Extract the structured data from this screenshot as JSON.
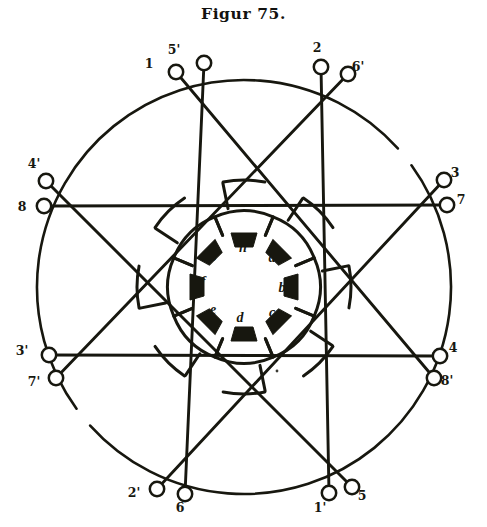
{
  "figure": {
    "title": "Figur 75.",
    "caption_position": "top-center",
    "ink_color": "#17170f",
    "paper_color": "#ffffff"
  },
  "geometry": {
    "center": {
      "x": 244,
      "y": 287
    },
    "outer_circle_radius": 207,
    "terminal_ring_radius": 211,
    "pole_ring_radius": 47,
    "lobe_ring_radius": 76,
    "arc_breaks": [
      {
        "start_deg": 318,
        "end_deg": 324
      },
      {
        "start_deg": 138,
        "end_deg": 144
      }
    ]
  },
  "terminals": [
    {
      "id": "t-1",
      "label": "1",
      "angle_deg": 247,
      "label_side": "left",
      "ring_x": 176,
      "ring_y": 72,
      "label_x": 149,
      "label_y": 68
    },
    {
      "id": "t-5p",
      "label": "5'",
      "angle_deg": 253,
      "label_side": "above",
      "ring_x": 204,
      "ring_y": 63,
      "label_x": 174,
      "label_y": 54
    },
    {
      "id": "t-2",
      "label": "2",
      "angle_deg": 287,
      "label_side": "above",
      "ring_x": 321,
      "ring_y": 67,
      "label_x": 317,
      "label_y": 52
    },
    {
      "id": "t-6p",
      "label": "6'",
      "angle_deg": 293,
      "label_side": "right",
      "ring_x": 348,
      "ring_y": 74,
      "label_x": 358,
      "label_y": 71
    },
    {
      "id": "t-4p",
      "label": "4'",
      "angle_deg": 200,
      "label_side": "above",
      "ring_x": 46,
      "ring_y": 181,
      "label_x": 34,
      "label_y": 168
    },
    {
      "id": "t-8",
      "label": "8",
      "angle_deg": 194,
      "label_side": "left",
      "ring_x": 44,
      "ring_y": 206,
      "label_x": 22,
      "label_y": 211
    },
    {
      "id": "t-3",
      "label": "3",
      "angle_deg": 340,
      "label_side": "right",
      "ring_x": 444,
      "ring_y": 180,
      "label_x": 455,
      "label_y": 177
    },
    {
      "id": "t-7",
      "label": "7",
      "angle_deg": 346,
      "label_side": "right",
      "ring_x": 447,
      "ring_y": 205,
      "label_x": 461,
      "label_y": 204
    },
    {
      "id": "t-3p",
      "label": "3'",
      "angle_deg": 160,
      "label_side": "left",
      "ring_x": 49,
      "ring_y": 355,
      "label_x": 22,
      "label_y": 355
    },
    {
      "id": "t-7p",
      "label": "7'",
      "angle_deg": 166,
      "label_side": "left",
      "ring_x": 56,
      "ring_y": 378,
      "label_x": 34,
      "label_y": 386
    },
    {
      "id": "t-4",
      "label": "4",
      "angle_deg": 20,
      "label_side": "right",
      "ring_x": 440,
      "ring_y": 356,
      "label_x": 453,
      "label_y": 352
    },
    {
      "id": "t-8p",
      "label": "8'",
      "angle_deg": 14,
      "label_side": "right",
      "ring_x": 434,
      "ring_y": 378,
      "label_x": 447,
      "label_y": 385
    },
    {
      "id": "t-2p",
      "label": "2'",
      "angle_deg": 112,
      "label_side": "left",
      "ring_x": 157,
      "ring_y": 489,
      "label_x": 134,
      "label_y": 497
    },
    {
      "id": "t-6",
      "label": "6",
      "angle_deg": 106,
      "label_side": "below",
      "ring_x": 185,
      "ring_y": 494,
      "label_x": 180,
      "label_y": 512
    },
    {
      "id": "t-1p",
      "label": "1'",
      "angle_deg": 73,
      "label_side": "below",
      "ring_x": 329,
      "ring_y": 493,
      "label_x": 320,
      "label_y": 512
    },
    {
      "id": "t-5",
      "label": "5",
      "angle_deg": 67,
      "label_side": "right",
      "ring_x": 352,
      "ring_y": 487,
      "label_x": 362,
      "label_y": 500
    }
  ],
  "chords": [
    {
      "id": "chord-horizontal-upper",
      "from": "t-8",
      "to": "t-7"
    },
    {
      "id": "chord-horizontal-lower",
      "from": "t-3p",
      "to": "t-4"
    },
    {
      "id": "chord-vertical-left",
      "from": "t-5p",
      "to": "t-6"
    },
    {
      "id": "chord-vertical-right",
      "from": "t-2",
      "to": "t-1p"
    },
    {
      "id": "chord-diag-a",
      "from": "t-1",
      "to": "t-8p"
    },
    {
      "id": "chord-diag-b",
      "from": "t-6p",
      "to": "t-7p"
    },
    {
      "id": "chord-diag-c",
      "from": "t-4p",
      "to": "t-5"
    },
    {
      "id": "chord-diag-d",
      "from": "t-3",
      "to": "t-2p"
    }
  ],
  "poles": [
    {
      "id": "pole-h",
      "label": "h",
      "angle_deg": 270,
      "label_x": 243,
      "label_y": 252
    },
    {
      "id": "pole-a",
      "label": "a",
      "angle_deg": 315,
      "label_x": 272,
      "label_y": 262
    },
    {
      "id": "pole-b",
      "label": "b",
      "angle_deg": 0,
      "label_x": 282,
      "label_y": 292
    },
    {
      "id": "pole-c",
      "label": "c",
      "angle_deg": 45,
      "label_x": 272,
      "label_y": 317
    },
    {
      "id": "pole-d",
      "label": "d",
      "angle_deg": 90,
      "label_x": 240,
      "label_y": 322
    },
    {
      "id": "pole-e",
      "label": "e",
      "angle_deg": 135,
      "label_x": 213,
      "label_y": 314
    },
    {
      "id": "pole-f",
      "label": "f",
      "angle_deg": 180,
      "label_x": 203,
      "label_y": 286
    },
    {
      "id": "pole-g",
      "label": "g",
      "angle_deg": 225,
      "label_x": 214,
      "label_y": 258
    }
  ],
  "speck": {
    "x": 277,
    "y": 371,
    "r": 1.4
  }
}
